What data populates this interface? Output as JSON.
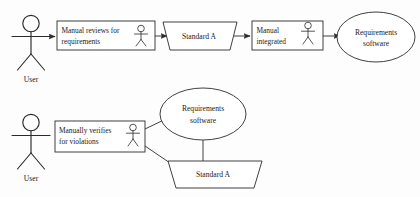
{
  "diagram": {
    "stroke_color": "#2b2b2b",
    "background_color": "#fdfdfd",
    "flows": [
      {
        "id": "top-flow",
        "nodes": [
          {
            "id": "actor-user-top",
            "type": "actor",
            "label": "User"
          },
          {
            "id": "activity-manual-reviews",
            "type": "activity-box",
            "label_line1": "Manual reviews for",
            "label_line2": "requirements",
            "has_actor_icon": true
          },
          {
            "id": "artifact-standard-a-top",
            "type": "artifact-parallelogram",
            "label": "Standard A"
          },
          {
            "id": "activity-manual-integrated",
            "type": "activity-box",
            "label_line1": "Manual",
            "label_line2": "integrated",
            "has_actor_icon": true
          },
          {
            "id": "ellipse-requirements-software-top",
            "type": "ellipse",
            "label_line1": "Requirements",
            "label_line2": "software"
          }
        ]
      },
      {
        "id": "bottom-flow",
        "nodes": [
          {
            "id": "actor-user-bottom",
            "type": "actor",
            "label": "User"
          },
          {
            "id": "activity-manually-verifies",
            "type": "activity-box",
            "label_line1": "Manually verifies",
            "label_line2": "for violations",
            "has_actor_icon": true
          },
          {
            "id": "ellipse-requirements-software-bottom",
            "type": "ellipse",
            "label_line1": "Requirements",
            "label_line2": "software"
          },
          {
            "id": "artifact-standard-a-bottom",
            "type": "artifact-parallelogram",
            "label": "Standard A"
          }
        ]
      }
    ]
  }
}
